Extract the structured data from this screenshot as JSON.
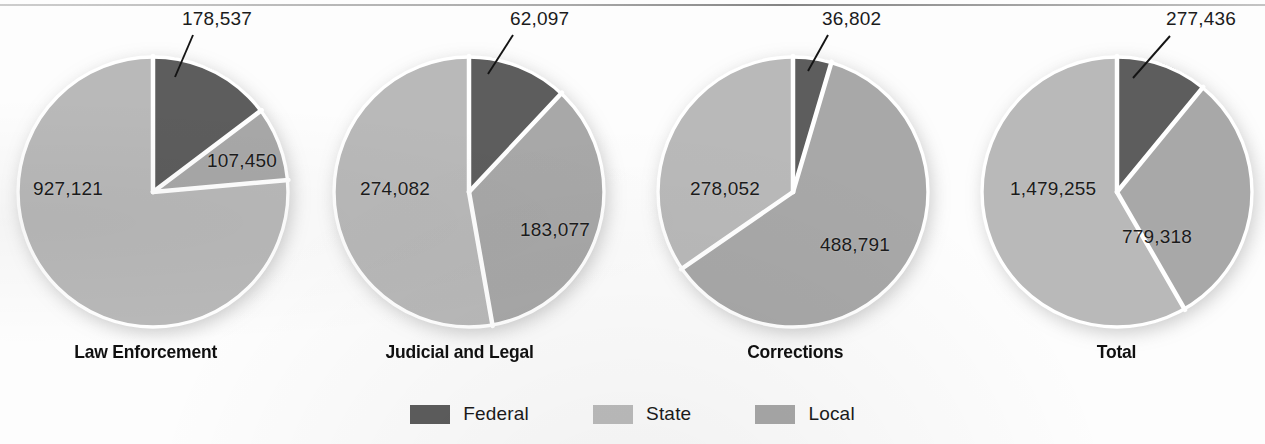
{
  "chart_data": {
    "type": "pie",
    "title": "",
    "subtitle": "",
    "xlabel": "",
    "ylabel": "",
    "grid": false,
    "legend_position": "bottom-center",
    "legend": [
      {
        "name": "Federal",
        "color": "#5d5d5d"
      },
      {
        "name": "State",
        "color": "#b9b9b9"
      },
      {
        "name": "Local",
        "color": "#a8a8a8"
      }
    ],
    "series": [
      {
        "name": "Federal",
        "values": [
          178537,
          62097,
          36802,
          277436
        ]
      },
      {
        "name": "Local",
        "values": [
          107450,
          183077,
          488791,
          779318
        ]
      },
      {
        "name": "State",
        "values": [
          927121,
          274082,
          278052,
          1479255
        ]
      }
    ],
    "categories": [
      "Law Enforcement",
      "Judicial and Legal",
      "Corrections",
      "Total"
    ],
    "charts": [
      {
        "caption": "Law Enforcement",
        "slices": [
          {
            "name": "Federal",
            "value": 178537,
            "label": "178,537",
            "color": "#5d5d5d",
            "start_deg": 0,
            "end_deg": 53.0
          },
          {
            "name": "Local",
            "value": 107450,
            "label": "107,450",
            "color": "#a8a8a8",
            "start_deg": 53.0,
            "end_deg": 84.9
          },
          {
            "name": "State",
            "value": 927121,
            "label": "927,121",
            "color": "#b9b9b9",
            "start_deg": 84.9,
            "end_deg": 360
          }
        ]
      },
      {
        "caption": "Judicial and Legal",
        "slices": [
          {
            "name": "Federal",
            "value": 62097,
            "label": "62,097",
            "color": "#5d5d5d",
            "start_deg": 0,
            "end_deg": 43.1
          },
          {
            "name": "Local",
            "value": 183077,
            "label": "183,077",
            "color": "#a8a8a8",
            "start_deg": 43.1,
            "end_deg": 170.0
          },
          {
            "name": "State",
            "value": 274082,
            "label": "274,082",
            "color": "#b9b9b9",
            "start_deg": 170.0,
            "end_deg": 360
          }
        ]
      },
      {
        "caption": "Corrections",
        "slices": [
          {
            "name": "Federal",
            "value": 36802,
            "label": "36,802",
            "color": "#5d5d5d",
            "start_deg": 0,
            "end_deg": 16.5
          },
          {
            "name": "Local",
            "value": 488791,
            "label": "488,791",
            "color": "#a8a8a8",
            "start_deg": 16.5,
            "end_deg": 235.4
          },
          {
            "name": "State",
            "value": 278052,
            "label": "278,052",
            "color": "#b9b9b9",
            "start_deg": 235.4,
            "end_deg": 360
          }
        ]
      },
      {
        "caption": "Total",
        "slices": [
          {
            "name": "Federal",
            "value": 277436,
            "label": "277,436",
            "color": "#5d5d5d",
            "start_deg": 0,
            "end_deg": 39.4
          },
          {
            "name": "Local",
            "value": 779318,
            "label": "779,318",
            "color": "#a8a8a8",
            "start_deg": 39.4,
            "end_deg": 150.0
          },
          {
            "name": "State",
            "value": 1479255,
            "label": "1,479,255",
            "color": "#b9b9b9",
            "start_deg": 150.0,
            "end_deg": 360
          }
        ]
      }
    ]
  },
  "charts": [
    {
      "caption": "Law Enforcement",
      "cx": 153,
      "cy": 192,
      "r": 136,
      "federal_label": "178,537",
      "local_label": "107,450",
      "state_label": "927,121",
      "federal_label_pos": {
        "x": 182,
        "y": 8
      },
      "local_label_pos": {
        "x": 207,
        "y": 150
      },
      "state_label_pos": {
        "x": 33,
        "y": 178
      },
      "leader": {
        "x1": 193,
        "y1": 35,
        "x2": 175,
        "y2": 77
      },
      "caption_pos": {
        "x": 68,
        "y": 341
      }
    },
    {
      "caption": "Judicial and Legal",
      "cx": 469,
      "cy": 192,
      "r": 136,
      "federal_label": "62,097",
      "local_label": "183,077",
      "state_label": "274,082",
      "federal_label_pos": {
        "x": 510,
        "y": 8
      },
      "local_label_pos": {
        "x": 520,
        "y": 219
      },
      "state_label_pos": {
        "x": 360,
        "y": 178
      },
      "leader": {
        "x1": 513,
        "y1": 35,
        "x2": 488,
        "y2": 74
      },
      "caption_pos": {
        "x": 379,
        "y": 341
      }
    },
    {
      "caption": "Corrections",
      "cx": 793,
      "cy": 192,
      "r": 136,
      "federal_label": "36,802",
      "local_label": "488,791",
      "state_label": "278,052",
      "federal_label_pos": {
        "x": 822,
        "y": 8
      },
      "local_label_pos": {
        "x": 820,
        "y": 234
      },
      "state_label_pos": {
        "x": 690,
        "y": 178
      },
      "leader": {
        "x1": 828,
        "y1": 35,
        "x2": 808,
        "y2": 71
      },
      "caption_pos": {
        "x": 743,
        "y": 341
      }
    },
    {
      "caption": "Total",
      "cx": 1117,
      "cy": 192,
      "r": 136,
      "federal_label": "277,436",
      "local_label": "779,318",
      "state_label": "1,479,255",
      "federal_label_pos": {
        "x": 1166,
        "y": 8
      },
      "local_label_pos": {
        "x": 1122,
        "y": 226
      },
      "state_label_pos": {
        "x": 1010,
        "y": 178
      },
      "leader": {
        "x1": 1170,
        "y1": 36,
        "x2": 1133,
        "y2": 78
      },
      "caption_pos": {
        "x": 1095,
        "y": 341
      }
    }
  ],
  "legend": {
    "items": [
      {
        "label": "Federal",
        "color": "#5d5d5d"
      },
      {
        "label": "State",
        "color": "#bdbdbd"
      },
      {
        "label": "Local",
        "color": "#a8a8a8"
      }
    ]
  }
}
